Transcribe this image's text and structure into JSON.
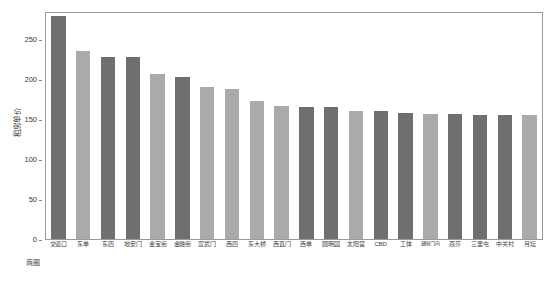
{
  "chart_data": {
    "type": "bar",
    "title": "",
    "subtitle": "",
    "xlabel": "商圈",
    "ylabel": "租房单价",
    "ylim": [
      0,
      285
    ],
    "yticks": [
      0,
      50,
      100,
      150,
      200,
      250
    ],
    "ytick_labels": [
      "0",
      "50",
      "100",
      "150",
      "200",
      "250"
    ],
    "grid": false,
    "legend": null,
    "legend_position": "none",
    "bar_colors": {
      "dark": "#6f6f6f",
      "light": "#aaaaaa"
    },
    "categories": [
      "交道口",
      "东单",
      "东四",
      "地安门",
      "金宝街",
      "金融街",
      "宣武门",
      "西四",
      "东大桥",
      "西直门",
      "西单",
      "圆明园",
      "太阳宫",
      "CBD",
      "工体",
      "建国门内",
      "燕莎",
      "三里屯",
      "中关村",
      "月坛"
    ],
    "values": [
      281,
      237,
      230,
      229,
      208,
      204,
      192,
      189,
      174,
      168,
      167,
      166,
      162,
      161,
      159,
      158,
      158,
      157,
      156,
      156
    ],
    "bar_shades": [
      "dark",
      "light",
      "dark",
      "dark",
      "light",
      "dark",
      "light",
      "light",
      "light",
      "light",
      "dark",
      "dark",
      "light",
      "dark",
      "dark",
      "light",
      "dark",
      "dark",
      "dark",
      "light"
    ]
  },
  "axes": {
    "y_title": "租房单价",
    "x_title": "商圈"
  }
}
